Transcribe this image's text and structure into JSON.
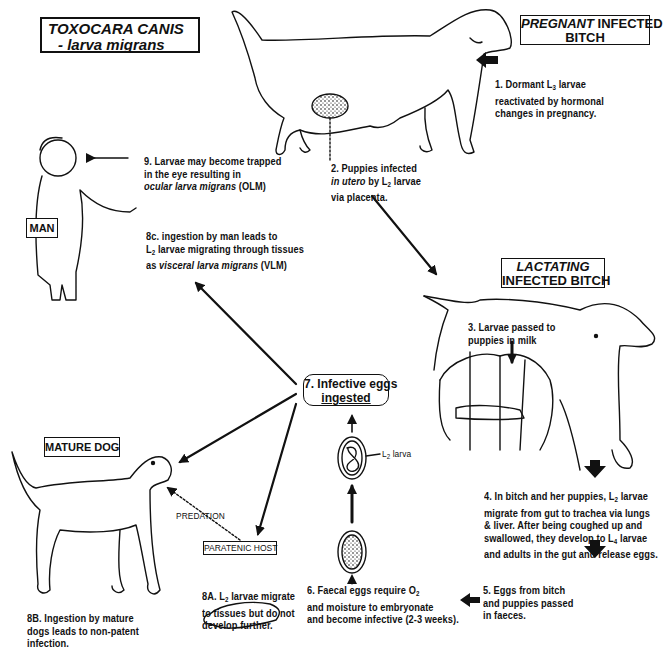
{
  "title": {
    "line1": "TOXOCARA CANIS",
    "line2": "- larva migrans"
  },
  "hosts": {
    "pregnant": {
      "italic": "PREGNANT",
      "rest": " INFECTED",
      "line2": "BITCH"
    },
    "lactating": {
      "line1": "LACTATING",
      "line2": "INFECTED BITCH"
    },
    "man": "MAN",
    "mature_dog": "MATURE DOG",
    "paratenic_host": "PARATENIC HOST",
    "predation": "PREDATION"
  },
  "steps": {
    "s1": {
      "l1a": "1. Dormant L",
      "l1sub": "3",
      "l1b": " larvae",
      "l2": "reactivated by hormonal",
      "l3": "changes in pregnancy."
    },
    "s2": {
      "l1": "2.  Puppies infected",
      "l2i": "in utero",
      "l2b": " by L",
      "l2sub": "2",
      "l2c": "  larvae",
      "l3": "via placenta."
    },
    "s3": {
      "l1": "3. Larvae passed to",
      "l2": "puppies in milk"
    },
    "s4": {
      "l1a": "4. In bitch and her puppies, L",
      "l1sub": "2",
      "l1b": " larvae",
      "l2": "migrate from gut to trachea via lungs",
      "l3": "& liver. After being coughed up and",
      "l4a": "swallowed, they develop  to L",
      "l4sub": "4",
      "l4b": " larvae",
      "l5": "and adults in the gut and release eggs."
    },
    "s5": {
      "l1": "5. Eggs from bitch",
      "l2": "and puppies passed",
      "l3": "in faeces."
    },
    "s6": {
      "l1a": "6. Faecal eggs require O",
      "l1sub": "2",
      "l2": "and moisture to embryonate",
      "l3": "and become infective (2-3 weeks)."
    },
    "s7": {
      "l1": "7. Infective eggs",
      "l2": "ingested"
    },
    "egg_label": {
      "a": "L",
      "sub": "2",
      "b": " larva"
    },
    "s8a": {
      "l1a": "8A.",
      "l1b": " L",
      "l1sub": "2",
      "l1c": " larvae migrate",
      "l2": "to tissues but do not",
      "l3": "develop further."
    },
    "s8b": {
      "l1": "8B. Ingestion by mature",
      "l2": "dogs leads to non-patent",
      "l3": "infection."
    },
    "s8c": {
      "l1": "8c. ingestion by man leads to",
      "l2a": "L",
      "l2sub": "2",
      "l2b": " larvae migrating through tissues",
      "l3a": "as ",
      "l3i": "visceral larva migrans",
      "l3b": "  (VLM)"
    },
    "s9": {
      "l1": "9. Larvae may become trapped",
      "l2": "in the eye resulting in",
      "l3i": "ocular larva migrans",
      "l3b": " (OLM)"
    }
  },
  "colors": {
    "ink": "#111111",
    "background": "#ffffff"
  }
}
